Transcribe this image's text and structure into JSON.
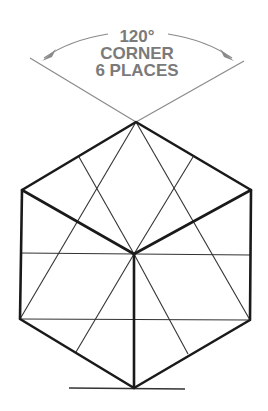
{
  "annotation": {
    "angle_label": "120°",
    "line2": "CORNER",
    "line3": "6 PLACES",
    "color": "#7a7a7a"
  },
  "figure": {
    "outline_color": "#1a1a1a",
    "construction_color": "#333333"
  }
}
